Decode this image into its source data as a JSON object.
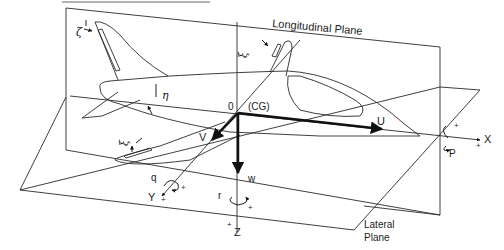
{
  "diagram": {
    "title_rule": true,
    "planes": {
      "longitudinal": "Longitudinal Plane",
      "lateral_line1": "Lateral",
      "lateral_line2": "Plane"
    },
    "origin": {
      "zero": "0",
      "cg": "(CG)"
    },
    "axes": {
      "x": "X",
      "y": "Y",
      "z": "Z",
      "plus": "+"
    },
    "velocities": {
      "u": "U",
      "v": "V",
      "w": "w"
    },
    "rates": {
      "p": "P",
      "q": "q",
      "r": "r"
    },
    "controls": {
      "rudder": "ζ",
      "elevator": "η",
      "aileron_right": "ξ",
      "aileron_left": "ξ"
    },
    "colors": {
      "line": "#2a2a2a",
      "rule": "#9a9a9a",
      "background": "#ffffff"
    }
  }
}
